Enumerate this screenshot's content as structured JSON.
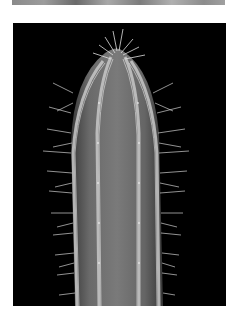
{
  "top_photo": {
    "description": "cropped strip of a grayscale photograph"
  },
  "main_photo": {
    "subject": "columnar cactus stem with ribs and spines",
    "background_color": "#000000",
    "body_color": "#6e6e6e",
    "rib_color": "#bdbdbd",
    "spine_color": "#d8d8d8"
  }
}
